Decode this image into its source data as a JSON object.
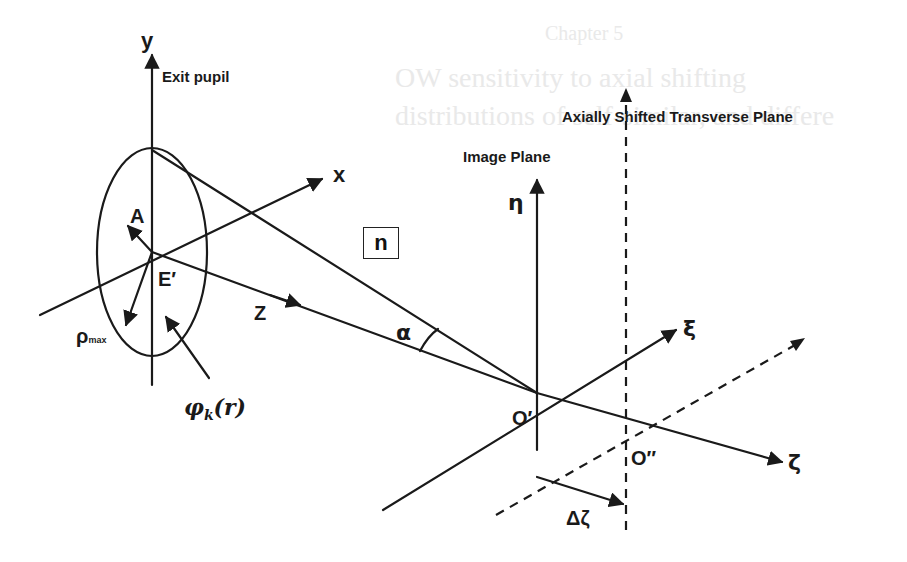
{
  "figure": {
    "labels": {
      "y_axis": "y",
      "x_axis": "x",
      "exit_pupil": "Exit pupil",
      "amplitude": "A",
      "center": "E′",
      "rho_max": "ρ",
      "rho_max_sub": "max",
      "z_axis": "Z",
      "phase": "φ",
      "phase_sub": "k",
      "phase_arg": "(r)",
      "medium_index": "n",
      "alpha": "α",
      "image_plane": "Image Plane",
      "eta_axis": "η",
      "xi_axis": "ξ",
      "zeta_axis": "ζ",
      "origin_image": "O′",
      "origin_shifted": "O″",
      "delta_zeta": "Δζ",
      "shifted_plane": "Axially Shifted Transverse Plane"
    },
    "colors": {
      "ink": "#1a1a1a",
      "background": "#ffffff",
      "bleed_through": "#e9e9e9"
    }
  },
  "bleed_through_text": [
    "Chapter 5",
    "OW sensitivity to axial shifting",
    "distributions of self-similar, and differe"
  ]
}
